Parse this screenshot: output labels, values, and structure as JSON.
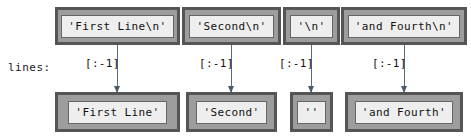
{
  "diagram": {
    "row_label": "lines:",
    "columns": [
      {
        "source": "'First Line\\n'",
        "operation": "[:-1]",
        "result": "'First Line'"
      },
      {
        "source": "'Second\\n'",
        "operation": "[:-1]",
        "result": "'Second'"
      },
      {
        "source": "'\\n'",
        "operation": "[:-1]",
        "result": "''"
      },
      {
        "source": "'and Fourth\\n'",
        "operation": "[:-1]",
        "result": "'and Fourth'"
      }
    ],
    "colors": {
      "box_border": "#555555",
      "box_fill": "#9d9d9d",
      "cell_fill": "#eeeeee",
      "arrow": "#5a6b7a",
      "text": "#111111",
      "background": "#ffffff"
    }
  }
}
